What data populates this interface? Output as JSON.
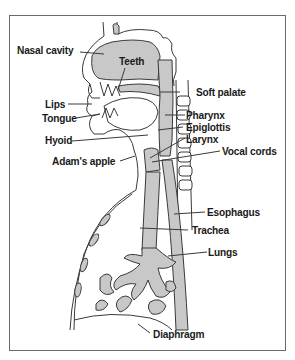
{
  "diagram": {
    "title": "",
    "colors": {
      "tissue_fill": "#c8c8c8",
      "line": "#3a3a3a",
      "background": "#ffffff",
      "frame": "#6a6a6a"
    },
    "labels": {
      "nasal_cavity": "Nasal cavity",
      "teeth": "Teeth",
      "soft_palate": "Soft palate",
      "lips": "Lips",
      "pharynx": "Pharynx",
      "tongue": "Tongue",
      "epiglottis": "Epiglottis",
      "hyoid": "Hyoid",
      "larynx": "Larynx",
      "vocal_cords": "Vocal cords",
      "adams_apple": "Adam's apple",
      "esophagus": "Esophagus",
      "trachea": "Trachea",
      "lungs": "Lungs",
      "diaphragm": "Diaphragm"
    }
  }
}
